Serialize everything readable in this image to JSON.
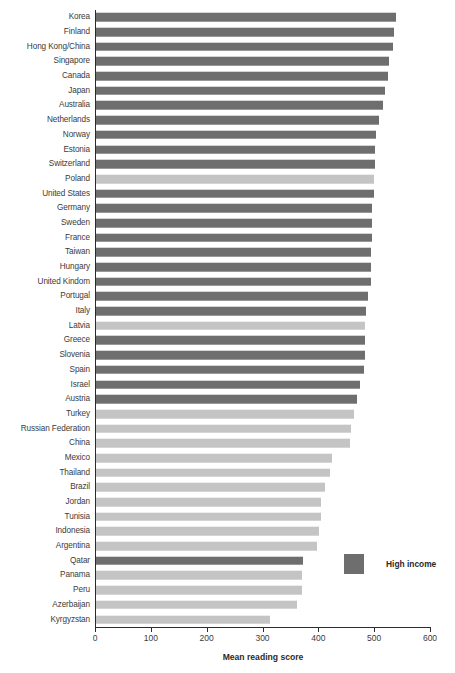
{
  "chart_data": {
    "type": "bar",
    "orientation": "horizontal",
    "title": "",
    "subtitle": "",
    "xlabel": "Mean reading score",
    "ylabel": "",
    "xlim": [
      0,
      600
    ],
    "xticks": [
      0,
      100,
      200,
      300,
      400,
      500,
      600
    ],
    "grid": false,
    "legend": {
      "position": "right-bottom",
      "entries": [
        {
          "label": "High income",
          "color": "#6e6e6e"
        }
      ]
    },
    "colors": {
      "high_income": "#6e6e6e",
      "other": "#c4c4c4",
      "axis": "#2b2b2b",
      "text": "#3b3b3b",
      "background": "#ffffff"
    },
    "categories": [
      "Korea",
      "Finland",
      "Hong Kong/China",
      "Singapore",
      "Canada",
      "Japan",
      "Australia",
      "Netherlands",
      "Norway",
      "Estonia",
      "Switzerland",
      "Poland",
      "United States",
      "Germany",
      "Sweden",
      "France",
      "Taiwan",
      "Hungary",
      "United Kindom",
      "Portugal",
      "Italy",
      "Latvia",
      "Greece",
      "Slovenia",
      "Spain",
      "Israel",
      "Austria",
      "Turkey",
      "Russian Federation",
      "China",
      "Mexico",
      "Thailand",
      "Brazil",
      "Jordan",
      "Tunisia",
      "Indonesia",
      "Argentina",
      "Qatar",
      "Panama",
      "Peru",
      "Azerbaijan",
      "Kyrgyzstan"
    ],
    "values": [
      539,
      536,
      533,
      526,
      524,
      520,
      515,
      508,
      503,
      501,
      501,
      500,
      500,
      497,
      497,
      496,
      495,
      494,
      494,
      489,
      486,
      484,
      483,
      483,
      481,
      474,
      470,
      464,
      459,
      456,
      425,
      421,
      412,
      405,
      404,
      402,
      398,
      372,
      371,
      370,
      362,
      314
    ],
    "series": [
      {
        "name": "Mean reading score",
        "values": [
          539,
          536,
          533,
          526,
          524,
          520,
          515,
          508,
          503,
          501,
          501,
          500,
          500,
          497,
          497,
          496,
          495,
          494,
          494,
          489,
          486,
          484,
          483,
          483,
          481,
          474,
          470,
          464,
          459,
          456,
          425,
          421,
          412,
          405,
          404,
          402,
          398,
          372,
          371,
          370,
          362,
          314
        ]
      }
    ],
    "group_flags": [
      "high",
      "high",
      "high",
      "high",
      "high",
      "high",
      "high",
      "high",
      "high",
      "high",
      "high",
      "low",
      "high",
      "high",
      "high",
      "high",
      "high",
      "high",
      "high",
      "high",
      "high",
      "low",
      "high",
      "high",
      "high",
      "high",
      "high",
      "low",
      "low",
      "low",
      "low",
      "low",
      "low",
      "low",
      "low",
      "low",
      "low",
      "high",
      "low",
      "low",
      "low",
      "low"
    ]
  }
}
